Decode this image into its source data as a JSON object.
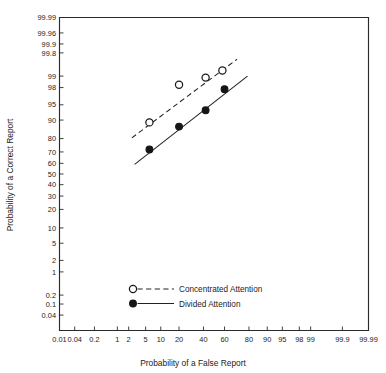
{
  "chart_data": {
    "type": "scatter",
    "title": "",
    "xlabel": "Probability of a False Report",
    "ylabel": "Probability of a Correct Report",
    "scale": "probit",
    "grid": false,
    "legend_position": "bottom-center",
    "xlim": [
      0.01,
      99.99
    ],
    "ylim": [
      0.01,
      99.99
    ],
    "xticks": [
      0.01,
      0.04,
      0.2,
      1,
      2,
      5,
      10,
      20,
      40,
      60,
      80,
      90,
      95,
      98,
      99,
      99.9,
      99.99
    ],
    "xtick_labels": [
      "0.01",
      "0.04",
      "0.2",
      "1",
      "2",
      "5",
      "10",
      "20",
      "40",
      "60",
      "80",
      "90",
      "95",
      "98",
      "99",
      "99.9",
      "99.99"
    ],
    "yticks": [
      0.04,
      0.1,
      0.2,
      1,
      2,
      5,
      10,
      20,
      30,
      40,
      50,
      60,
      70,
      80,
      90,
      95,
      98,
      99,
      99.8,
      99.9,
      99.96,
      99.99
    ],
    "ytick_labels": [
      "0.04",
      "0.1",
      "0.2",
      "1",
      "2",
      "5",
      "10",
      "20",
      "30",
      "40",
      "50",
      "60",
      "70",
      "80",
      "90",
      "95",
      "98",
      "99",
      "99.8",
      "99.9",
      "99.96",
      "99.99"
    ],
    "series": [
      {
        "name": "Concentrated Attention",
        "marker": "open-circle",
        "line": "dashed",
        "points": [
          {
            "x": 6.0,
            "y": 89.0
          },
          {
            "x": 20.0,
            "y": 98.3
          },
          {
            "x": 42.0,
            "y": 98.9
          },
          {
            "x": 58.0,
            "y": 99.3
          }
        ],
        "fit_line": {
          "x0": 2.4,
          "y0": 80.5,
          "x1": 71.0,
          "y1": 99.68
        }
      },
      {
        "name": "Divided Attention",
        "marker": "filled-circle",
        "line": "solid",
        "points": [
          {
            "x": 6.0,
            "y": 72.0
          },
          {
            "x": 20.0,
            "y": 87.0
          },
          {
            "x": 42.0,
            "y": 93.5
          },
          {
            "x": 60.0,
            "y": 97.8
          }
        ],
        "fit_line": {
          "x0": 2.8,
          "y0": 59.0,
          "x1": 79.0,
          "y1": 99.0
        }
      }
    ]
  },
  "legend": {
    "entries": [
      {
        "label": "Concentrated Attention",
        "marker": "open-circle-icon",
        "line": "dashed-line-icon"
      },
      {
        "label": "Divided Attention",
        "marker": "filled-circle-icon",
        "line": "solid-line-icon"
      }
    ]
  }
}
